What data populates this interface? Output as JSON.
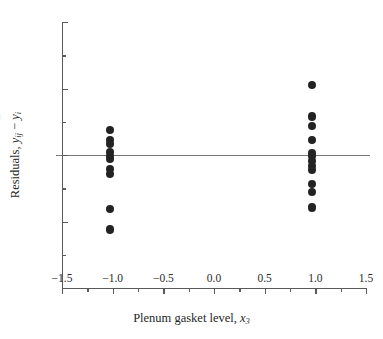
{
  "chart_data": {
    "type": "scatter",
    "title": "",
    "xlabel": "Plenum gasket level, x3",
    "ylabel": "Residuals, yij - yi-hat",
    "xlim": [
      -1.5,
      1.5
    ],
    "ylim": [
      -2,
      2
    ],
    "grid": false,
    "legend": null,
    "reference_lines": [
      {
        "orientation": "horizontal",
        "value": 0
      }
    ],
    "x_ticks": [
      {
        "value": -1.5,
        "label": "−1.5"
      },
      {
        "value": -1.0,
        "label": "−1.0"
      },
      {
        "value": -0.5,
        "label": "−0.5"
      },
      {
        "value": 0.0,
        "label": "0.0"
      },
      {
        "value": 0.5,
        "label": "0.5"
      },
      {
        "value": 1.0,
        "label": "1.0"
      },
      {
        "value": 1.5,
        "label": "1.5"
      }
    ],
    "x_minor_ticks": [
      -1.25,
      -0.75,
      -0.25,
      0.25,
      0.75,
      1.25
    ],
    "y_ticks": [
      {
        "value": -2,
        "label": "−2"
      },
      {
        "value": -1,
        "label": "−1"
      },
      {
        "value": 0,
        "label": "0"
      },
      {
        "value": 1,
        "label": "1"
      },
      {
        "value": 2,
        "label": "2"
      }
    ],
    "y_minor_ticks": [
      -1.5,
      -0.5,
      0.5,
      1.5
    ],
    "marker": {
      "shape": "circle",
      "color": "#232323",
      "size": 8
    },
    "groups": [
      {
        "name": "gasket level -1",
        "x": -1.03,
        "values": [
          0.37,
          0.22,
          0.16,
          0.04,
          -0.01,
          -0.06,
          -0.21,
          -0.29,
          -0.81,
          -1.12
        ]
      },
      {
        "name": "gasket level +1",
        "x": 0.97,
        "values": [
          1.05,
          0.58,
          0.43,
          0.22,
          0.03,
          -0.02,
          -0.09,
          -0.16,
          -0.22,
          -0.43,
          -0.56,
          -0.79
        ]
      }
    ],
    "points": [
      {
        "x": -1.03,
        "y": 0.37
      },
      {
        "x": -1.03,
        "y": 0.22
      },
      {
        "x": -1.03,
        "y": 0.16
      },
      {
        "x": -1.03,
        "y": 0.04
      },
      {
        "x": -1.03,
        "y": -0.01
      },
      {
        "x": -1.03,
        "y": -0.06
      },
      {
        "x": -1.03,
        "y": -0.21
      },
      {
        "x": -1.03,
        "y": -0.29
      },
      {
        "x": -1.03,
        "y": -0.81
      },
      {
        "x": -1.03,
        "y": -1.12
      },
      {
        "x": 0.97,
        "y": 1.05
      },
      {
        "x": 0.97,
        "y": 0.58
      },
      {
        "x": 0.97,
        "y": 0.43
      },
      {
        "x": 0.97,
        "y": 0.22
      },
      {
        "x": 0.97,
        "y": 0.03
      },
      {
        "x": 0.97,
        "y": -0.02
      },
      {
        "x": 0.97,
        "y": -0.09
      },
      {
        "x": 0.97,
        "y": -0.16
      },
      {
        "x": 0.97,
        "y": -0.22
      },
      {
        "x": 0.97,
        "y": -0.43
      },
      {
        "x": 0.97,
        "y": -0.56
      },
      {
        "x": 0.97,
        "y": -0.79
      }
    ]
  },
  "axis_titles": {
    "x_prefix": "Plenum gasket level, ",
    "x_var": "x",
    "x_sub": "3",
    "y_prefix": "Residuals, ",
    "y_var": "y",
    "y_sub": "ij",
    "y_minus": " − ",
    "y_hat_var": "y",
    "y_hat_mark": "ˆ",
    "y_hat_sub": "i"
  },
  "colors": {
    "axis": "#5a5a5a",
    "zero_line": "#777777",
    "marker": "#232323",
    "text": "#1f1f1f",
    "background": "#ffffff"
  }
}
